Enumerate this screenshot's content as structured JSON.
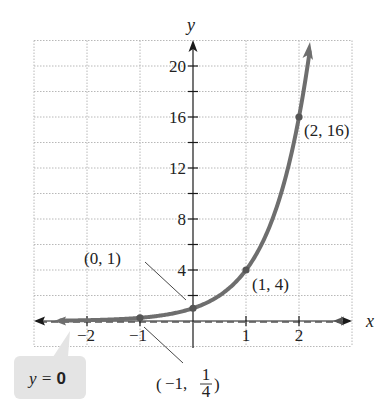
{
  "chart_data": {
    "type": "line",
    "title": "",
    "function": "y = 4^x",
    "xlabel": "x",
    "ylabel": "y",
    "xlim": [
      -3,
      3
    ],
    "ylim": [
      -2,
      22
    ],
    "grid": true,
    "x_ticks": [
      -2,
      -1,
      1,
      2
    ],
    "x_tick_labels": [
      "−2",
      "−1",
      "1",
      "2"
    ],
    "y_ticks_minor": [
      2,
      4,
      6,
      8,
      10,
      12,
      14,
      16,
      18,
      20
    ],
    "y_ticks": [
      4,
      8,
      12,
      16,
      20
    ],
    "y_tick_labels": [
      "4",
      "8",
      "12",
      "16",
      "20"
    ],
    "series": [
      {
        "name": "exponential curve",
        "color": "#6e6e6e",
        "x": [
          -1,
          0,
          1,
          2
        ],
        "y": [
          0.25,
          1,
          4,
          16
        ]
      }
    ],
    "points": [
      {
        "x": -1,
        "y": 0.25,
        "label_prefix": "(−1, ",
        "label_num": "1",
        "label_den": "4",
        "label_suffix": ")"
      },
      {
        "x": 0,
        "y": 1,
        "label": "(0, 1)"
      },
      {
        "x": 1,
        "y": 4,
        "label": "(1, 4)"
      },
      {
        "x": 2,
        "y": 16,
        "label": "(2, 16)"
      }
    ],
    "asymptote": {
      "equation_prefix": "y = ",
      "equation_value": "0",
      "style": "dashed"
    },
    "colors": {
      "curve": "#6e6e6e",
      "point": "#555555",
      "axis": "#1a1a1a",
      "grid": "#b8b8b8",
      "callout_bg": "#e4e4e4"
    }
  },
  "labels": {
    "x_axis": "x",
    "y_axis": "y",
    "pt_m1_open": "(",
    "pt_m1_close": ")",
    "pt_m1_text": "−1,",
    "pt_m1_num": "1",
    "pt_m1_den": "4",
    "pt_0": "(0, 1)",
    "pt_1": "(1, 4)",
    "pt_2": "(2, 16)",
    "callout_prefix": "y = ",
    "callout_value": "0"
  }
}
